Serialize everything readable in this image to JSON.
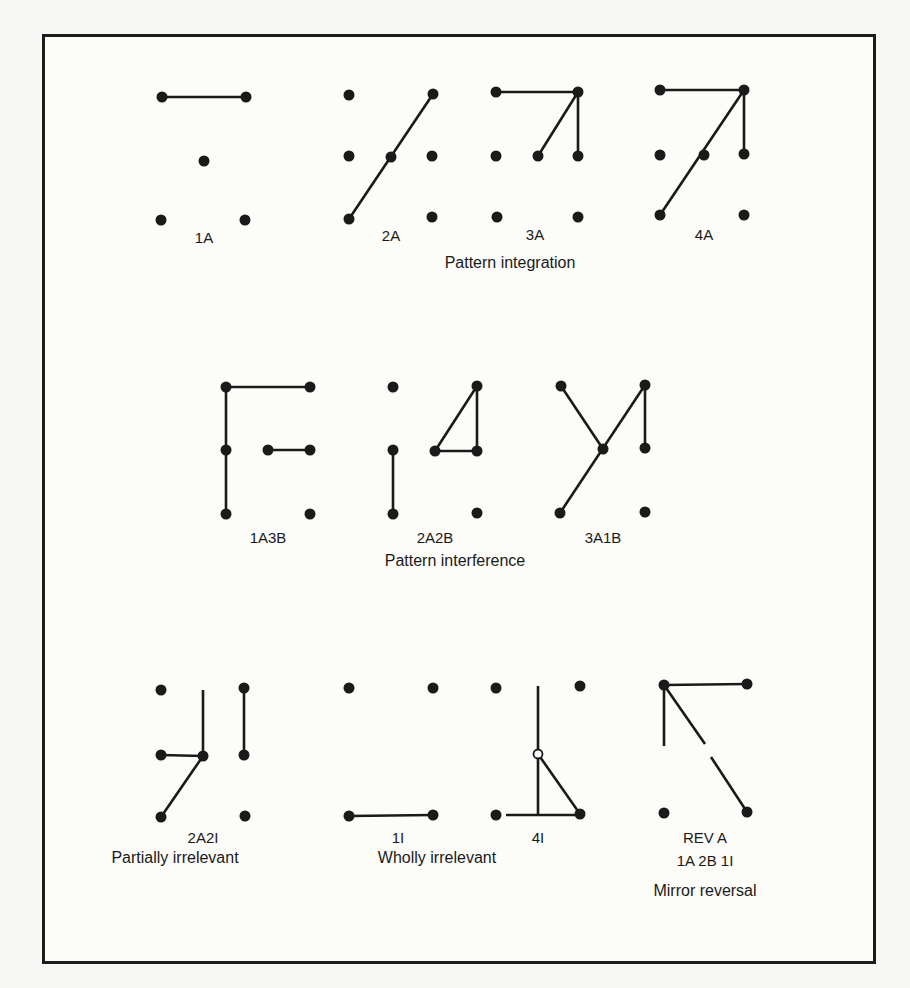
{
  "figure": {
    "ink_color": "#1a1a1a",
    "frame_color": "#1c1c1c",
    "background_color": "#f7f7f5",
    "sections": [
      {
        "caption": "Pattern integration",
        "caption_pos": [
          510,
          268
        ],
        "patterns": [
          {
            "label": "1A",
            "label_pos": [
              204,
              243
            ],
            "dots": [
              [
                162,
                97
              ],
              [
                246,
                97
              ],
              [
                204,
                161
              ],
              [
                161,
                220
              ],
              [
                245,
                220
              ]
            ],
            "hollow": [],
            "lines": [
              [
                [
                  162,
                  97
                ],
                [
                  246,
                  97
                ]
              ]
            ]
          },
          {
            "label": "2A",
            "label_pos": [
              391,
              241
            ],
            "dots": [
              [
                349,
                95
              ],
              [
                433,
                94
              ],
              [
                349,
                156
              ],
              [
                391,
                157
              ],
              [
                432,
                156
              ],
              [
                349,
                219
              ],
              [
                432,
                217
              ]
            ],
            "hollow": [],
            "lines": [
              [
                [
                  433,
                  94
                ],
                [
                  349,
                  219
                ]
              ]
            ]
          },
          {
            "label": "3A",
            "label_pos": [
              535,
              240
            ],
            "dots": [
              [
                496,
                92
              ],
              [
                578,
                92
              ],
              [
                496,
                156
              ],
              [
                538,
                156
              ],
              [
                578,
                156
              ],
              [
                497,
                217
              ],
              [
                578,
                217
              ]
            ],
            "hollow": [],
            "lines": [
              [
                [
                  496,
                  92
                ],
                [
                  578,
                  92
                ]
              ],
              [
                [
                  578,
                  92
                ],
                [
                  538,
                  156
                ]
              ],
              [
                [
                  578,
                  92
                ],
                [
                  578,
                  156
                ]
              ]
            ]
          },
          {
            "label": "4A",
            "label_pos": [
              704,
              240
            ],
            "dots": [
              [
                660,
                90
              ],
              [
                744,
                90
              ],
              [
                660,
                155
              ],
              [
                704,
                155
              ],
              [
                744,
                154
              ],
              [
                660,
                215
              ],
              [
                744,
                215
              ]
            ],
            "hollow": [],
            "lines": [
              [
                [
                  660,
                  90
                ],
                [
                  744,
                  90
                ]
              ],
              [
                [
                  744,
                  90
                ],
                [
                  660,
                  215
                ]
              ],
              [
                [
                  744,
                  90
                ],
                [
                  744,
                  154
                ]
              ]
            ]
          }
        ]
      },
      {
        "caption": "Pattern interference",
        "caption_pos": [
          455,
          566
        ],
        "patterns": [
          {
            "label": "1A3B",
            "label_pos": [
              268,
              543
            ],
            "dots": [
              [
                226,
                387
              ],
              [
                310,
                387
              ],
              [
                226,
                450
              ],
              [
                268,
                450
              ],
              [
                310,
                450
              ],
              [
                226,
                514
              ],
              [
                310,
                514
              ]
            ],
            "hollow": [],
            "lines": [
              [
                [
                  226,
                  387
                ],
                [
                  310,
                  387
                ]
              ],
              [
                [
                  226,
                  387
                ],
                [
                  226,
                  514
                ]
              ],
              [
                [
                  268,
                  450
                ],
                [
                  310,
                  450
                ]
              ]
            ]
          },
          {
            "label": "2A2B",
            "label_pos": [
              435,
              543
            ],
            "dots": [
              [
                393,
                387
              ],
              [
                477,
                386
              ],
              [
                393,
                450
              ],
              [
                435,
                451
              ],
              [
                477,
                451
              ],
              [
                393,
                514
              ],
              [
                477,
                513
              ]
            ],
            "hollow": [],
            "lines": [
              [
                [
                  477,
                  386
                ],
                [
                  435,
                  451
                ]
              ],
              [
                [
                  477,
                  386
                ],
                [
                  477,
                  451
                ]
              ],
              [
                [
                  435,
                  451
                ],
                [
                  477,
                  451
                ]
              ],
              [
                [
                  393,
                  450
                ],
                [
                  393,
                  514
                ]
              ]
            ]
          },
          {
            "label": "3A1B",
            "label_pos": [
              603,
              543
            ],
            "dots": [
              [
                561,
                386
              ],
              [
                645,
                385
              ],
              [
                603,
                449
              ],
              [
                645,
                448
              ],
              [
                560,
                513
              ],
              [
                645,
                512
              ]
            ],
            "hollow": [],
            "lines": [
              [
                [
                  561,
                  386
                ],
                [
                  603,
                  449
                ]
              ],
              [
                [
                  645,
                  385
                ],
                [
                  560,
                  513
                ]
              ],
              [
                [
                  645,
                  385
                ],
                [
                  645,
                  448
                ]
              ]
            ]
          }
        ]
      },
      {
        "caption": "Partially irrelevant",
        "caption_pos": [
          175,
          863
        ],
        "patterns": [
          {
            "label": "2A2I",
            "label_pos": [
              203,
              843
            ],
            "dots": [
              [
                161,
                690
              ],
              [
                244,
                688
              ],
              [
                161,
                755
              ],
              [
                203,
                756
              ],
              [
                244,
                755
              ],
              [
                161,
                817
              ],
              [
                245,
                816
              ]
            ],
            "hollow": [],
            "lines": [
              [
                [
                  203,
                  690
                ],
                [
                  203,
                  756
                ]
              ],
              [
                [
                  161,
                  755
                ],
                [
                  203,
                  756
                ]
              ],
              [
                [
                  203,
                  756
                ],
                [
                  161,
                  817
                ]
              ],
              [
                [
                  244,
                  688
                ],
                [
                  244,
                  755
                ]
              ]
            ]
          }
        ]
      },
      {
        "caption": "Wholly irrelevant",
        "caption_pos": [
          437,
          863
        ],
        "patterns": [
          {
            "label": "1I",
            "label_pos": [
              398,
              843
            ],
            "dots": [
              [
                349,
                688
              ],
              [
                433,
                688
              ],
              [
                349,
                816
              ],
              [
                433,
                815
              ]
            ],
            "hollow": [],
            "lines": [
              [
                [
                  349,
                  816
                ],
                [
                  433,
                  815
                ]
              ]
            ]
          },
          {
            "label": "4I",
            "label_pos": [
              538,
              843
            ],
            "dots": [
              [
                496,
                688
              ],
              [
                580,
                686
              ],
              [
                496,
                815
              ],
              [
                580,
                814
              ]
            ],
            "hollow": [
              [
                538,
                754
              ]
            ],
            "lines": [
              [
                [
                  538,
                  686
                ],
                [
                  538,
                  815
                ]
              ],
              [
                [
                  538,
                  754
                ],
                [
                  580,
                  814
                ]
              ],
              [
                [
                  506,
                  815
                ],
                [
                  580,
                  815
                ]
              ]
            ]
          }
        ]
      },
      {
        "caption": "Mirror reversal",
        "caption_pos": [
          705,
          896
        ],
        "patterns": [
          {
            "label": "REV A",
            "label_pos": [
              705,
              843
            ],
            "sublabel": "1A 2B 1I",
            "sublabel_pos": [
              705,
              866
            ],
            "dots": [
              [
                664,
                685
              ],
              [
                747,
                684
              ],
              [
                664,
                813
              ],
              [
                747,
                812
              ]
            ],
            "hollow": [],
            "lines": [
              [
                [
                  664,
                  685
                ],
                [
                  747,
                  684
                ]
              ],
              [
                [
                  664,
                  685
                ],
                [
                  664,
                  746
                ]
              ],
              [
                [
                  664,
                  685
                ],
                [
                  705,
                  744
                ]
              ],
              [
                [
                  711,
                  757
                ],
                [
                  747,
                  812
                ]
              ]
            ]
          }
        ]
      }
    ]
  }
}
